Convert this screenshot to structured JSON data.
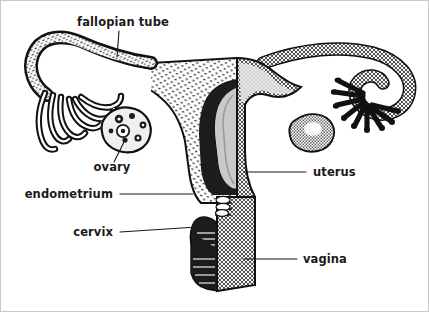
{
  "figure": {
    "background_color": "#ffffff",
    "border_color": "#c8c8c8",
    "ink_color": "#1a1a1a"
  },
  "labels": [
    {
      "id": "fallopian-tube",
      "text": "fallopian tube",
      "anchor": "middle",
      "x": 122,
      "y": 25,
      "leader": "M118,30 L116,56"
    },
    {
      "id": "ovary",
      "text": "ovary",
      "anchor": "middle",
      "x": 111,
      "y": 170,
      "leader": "M113,161 L124,139"
    },
    {
      "id": "endometrium",
      "text": "endometrium",
      "anchor": "end",
      "x": 112,
      "y": 197,
      "leader": "M119,193 L192,193"
    },
    {
      "id": "cervix",
      "text": "cervix",
      "anchor": "end",
      "x": 112,
      "y": 235,
      "leader": "M119,231 L196,226"
    },
    {
      "id": "uterus",
      "text": "uterus",
      "anchor": "start",
      "x": 312,
      "y": 175,
      "leader": "M305,171 L243,171"
    },
    {
      "id": "vagina",
      "text": "vagina",
      "anchor": "start",
      "x": 302,
      "y": 262,
      "leader": "M296,258 L243,258"
    }
  ],
  "structures": {
    "left_fimbriae": "open fringed finger-like projections, outlined strands",
    "left_tube": "cut-open fallopian tube showing lumen, stippled wall",
    "left_ovary": "irregular blob containing follicles",
    "uterus_cutaway": "left half sectioned: stippled myometrium with dark endometrium lining",
    "uterus_exterior": "right half solid gray halftone body",
    "cervix_folds": "dark rugae at cervical canal",
    "vagina_tube": "gray halftone canal below cervix",
    "right_ovary": "smooth gray halftone oval with highlight",
    "right_tube": "gray halftone tube arcing down and hooking back",
    "right_fimbriae": "solid black finger-like projections"
  },
  "colors": {
    "halftone_gray": "#a8a8a8",
    "stipple_gray": "#d8d8d8",
    "dark_ink": "#111111",
    "light_fill": "#e8e8e8"
  }
}
